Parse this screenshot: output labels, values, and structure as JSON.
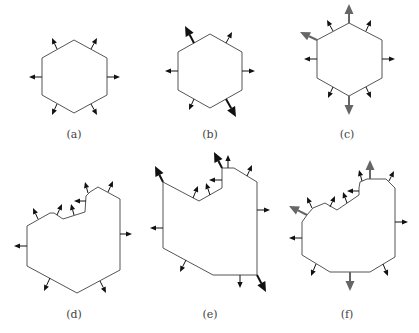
{
  "figure": {
    "colors": {
      "outline": "#555555",
      "arrow_black": "#111111",
      "arrow_gray": "#666666"
    },
    "panels": [
      {
        "id": "a",
        "label": "(a)",
        "label_pos": [
          74,
          128
        ],
        "polygon": [
          [
            74,
            40
          ],
          [
            107,
            58
          ],
          [
            107,
            95
          ],
          [
            74,
            113
          ],
          [
            42,
            95
          ],
          [
            42,
            58
          ]
        ],
        "arrows": [
          {
            "from": [
              57,
              49
            ],
            "to": [
              52,
              38
            ],
            "size": "small",
            "color": "black"
          },
          {
            "from": [
              91,
              49
            ],
            "to": [
              97,
              38
            ],
            "size": "small",
            "color": "black"
          },
          {
            "from": [
              42,
              77
            ],
            "to": [
              29,
              77
            ],
            "size": "small",
            "color": "black"
          },
          {
            "from": [
              107,
              77
            ],
            "to": [
              120,
              77
            ],
            "size": "small",
            "color": "black"
          },
          {
            "from": [
              57,
              104
            ],
            "to": [
              52,
              115
            ],
            "size": "small",
            "color": "black"
          },
          {
            "from": [
              91,
              104
            ],
            "to": [
              97,
              115
            ],
            "size": "small",
            "color": "black"
          }
        ]
      },
      {
        "id": "b",
        "label": "(b)",
        "label_pos": [
          210,
          128
        ],
        "polygon": [
          [
            210,
            34
          ],
          [
            242,
            52
          ],
          [
            242,
            90
          ],
          [
            210,
            108
          ],
          [
            178,
            90
          ],
          [
            178,
            52
          ]
        ],
        "arrows": [
          {
            "from": [
              194,
              43
            ],
            "to": [
              185,
              26
            ],
            "size": "large",
            "color": "black"
          },
          {
            "from": [
              226,
              43
            ],
            "to": [
              232,
              32
            ],
            "size": "small",
            "color": "black"
          },
          {
            "from": [
              178,
              71
            ],
            "to": [
              165,
              71
            ],
            "size": "small",
            "color": "black"
          },
          {
            "from": [
              242,
              71
            ],
            "to": [
              255,
              71
            ],
            "size": "small",
            "color": "black"
          },
          {
            "from": [
              194,
              99
            ],
            "to": [
              189,
              110
            ],
            "size": "small",
            "color": "black"
          },
          {
            "from": [
              226,
              99
            ],
            "to": [
              236,
              117
            ],
            "size": "large",
            "color": "black"
          }
        ]
      },
      {
        "id": "c",
        "label": "(c)",
        "label_pos": [
          347,
          128
        ],
        "polygon": [
          [
            349,
            23
          ],
          [
            382,
            40
          ],
          [
            382,
            78
          ],
          [
            349,
            96
          ],
          [
            317,
            78
          ],
          [
            317,
            40
          ]
        ],
        "arrows": [
          {
            "from": [
              349,
              23
            ],
            "to": [
              349,
              4
            ],
            "size": "large",
            "color": "gray"
          },
          {
            "from": [
              317,
              40
            ],
            "to": [
              300,
              32
            ],
            "size": "large",
            "color": "gray"
          },
          {
            "from": [
              349,
              96
            ],
            "to": [
              349,
              115
            ],
            "size": "large",
            "color": "gray"
          },
          {
            "from": [
              333,
              31
            ],
            "to": [
              327,
              20
            ],
            "size": "small",
            "color": "black"
          },
          {
            "from": [
              366,
              31
            ],
            "to": [
              371,
              20
            ],
            "size": "small",
            "color": "black"
          },
          {
            "from": [
              317,
              59
            ],
            "to": [
              304,
              59
            ],
            "size": "small",
            "color": "black"
          },
          {
            "from": [
              382,
              59
            ],
            "to": [
              395,
              59
            ],
            "size": "small",
            "color": "black"
          },
          {
            "from": [
              333,
              87
            ],
            "to": [
              328,
              98
            ],
            "size": "small",
            "color": "black"
          },
          {
            "from": [
              366,
              87
            ],
            "to": [
              371,
              98
            ],
            "size": "small",
            "color": "black"
          }
        ]
      },
      {
        "id": "d",
        "label": "(d)",
        "label_pos": [
          74,
          308
        ],
        "polygon": [
          [
            27,
            226
          ],
          [
            50,
            213
          ],
          [
            54,
            213
          ],
          [
            63,
            219
          ],
          [
            85,
            212
          ],
          [
            86,
            196
          ],
          [
            90,
            192
          ],
          [
            98,
            187
          ],
          [
            120,
            199
          ],
          [
            120,
            270
          ],
          [
            77,
            293
          ],
          [
            27,
            266
          ]
        ],
        "arrows": [
          {
            "from": [
              38,
              219
            ],
            "to": [
              33,
              208
            ],
            "size": "small",
            "color": "black"
          },
          {
            "from": [
              57,
              215
            ],
            "to": [
              62,
              204
            ],
            "size": "small",
            "color": "black"
          },
          {
            "from": [
              74,
              215
            ],
            "to": [
              71,
              204
            ],
            "size": "small",
            "color": "black"
          },
          {
            "from": [
              86,
              201
            ],
            "to": [
              74,
              201
            ],
            "size": "small",
            "color": "black"
          },
          {
            "from": [
              88,
              193
            ],
            "to": [
              85,
              182
            ],
            "size": "small",
            "color": "black"
          },
          {
            "from": [
              108,
              192
            ],
            "to": [
              113,
              181
            ],
            "size": "small",
            "color": "black"
          },
          {
            "from": [
              120,
              234
            ],
            "to": [
              132,
              234
            ],
            "size": "small",
            "color": "black"
          },
          {
            "from": [
              27,
              246
            ],
            "to": [
              14,
              246
            ],
            "size": "small",
            "color": "black"
          },
          {
            "from": [
              50,
              278
            ],
            "to": [
              44,
              291
            ],
            "size": "small",
            "color": "black"
          },
          {
            "from": [
              100,
              281
            ],
            "to": [
              106,
              293
            ],
            "size": "small",
            "color": "black"
          }
        ]
      },
      {
        "id": "e",
        "label": "(e)",
        "label_pos": [
          210,
          308
        ],
        "polygon": [
          [
            163,
            182
          ],
          [
            199,
            201
          ],
          [
            222,
            188
          ],
          [
            222,
            168
          ],
          [
            234,
            168
          ],
          [
            257,
            182
          ],
          [
            257,
            275
          ],
          [
            213,
            275
          ],
          [
            163,
            248
          ]
        ],
        "arrows": [
          {
            "from": [
              163,
              182
            ],
            "to": [
              155,
              166
            ],
            "size": "large",
            "color": "black"
          },
          {
            "from": [
              222,
              168
            ],
            "to": [
              214,
              152
            ],
            "size": "large",
            "color": "black"
          },
          {
            "from": [
              257,
              275
            ],
            "to": [
              266,
              292
            ],
            "size": "large",
            "color": "black"
          },
          {
            "from": [
              193,
              198
            ],
            "to": [
              198,
              186
            ],
            "size": "small",
            "color": "black"
          },
          {
            "from": [
              210,
              195
            ],
            "to": [
              206,
              183
            ],
            "size": "small",
            "color": "black"
          },
          {
            "from": [
              222,
              180
            ],
            "to": [
              209,
              180
            ],
            "size": "small",
            "color": "black"
          },
          {
            "from": [
              228,
              168
            ],
            "to": [
              228,
              155
            ],
            "size": "small",
            "color": "black"
          },
          {
            "from": [
              247,
              176
            ],
            "to": [
              252,
              165
            ],
            "size": "small",
            "color": "black"
          },
          {
            "from": [
              257,
              210
            ],
            "to": [
              270,
              210
            ],
            "size": "small",
            "color": "black"
          },
          {
            "from": [
              163,
              228
            ],
            "to": [
              150,
              228
            ],
            "size": "small",
            "color": "black"
          },
          {
            "from": [
              186,
              260
            ],
            "to": [
              180,
              272
            ],
            "size": "small",
            "color": "black"
          },
          {
            "from": [
              240,
              275
            ],
            "to": [
              240,
              288
            ],
            "size": "small",
            "color": "black"
          }
        ]
      },
      {
        "id": "f",
        "label": "(f)",
        "label_pos": [
          347,
          308
        ],
        "polygon": [
          [
            307,
            215
          ],
          [
            313,
            208
          ],
          [
            325,
            203
          ],
          [
            337,
            210
          ],
          [
            359,
            195
          ],
          [
            359,
            188
          ],
          [
            360,
            182
          ],
          [
            367,
            179
          ],
          [
            386,
            179
          ],
          [
            395,
            188
          ],
          [
            395,
            257
          ],
          [
            370,
            272
          ],
          [
            330,
            272
          ],
          [
            302,
            255
          ],
          [
            302,
            222
          ]
        ],
        "arrows": [
          {
            "from": [
              307,
              215
            ],
            "to": [
              289,
              206
            ],
            "size": "large",
            "color": "gray"
          },
          {
            "from": [
              370,
              179
            ],
            "to": [
              370,
              160
            ],
            "size": "large",
            "color": "gray"
          },
          {
            "from": [
              350,
              272
            ],
            "to": [
              350,
              291
            ],
            "size": "large",
            "color": "gray"
          },
          {
            "from": [
              312,
              208
            ],
            "to": [
              307,
              197
            ],
            "size": "small",
            "color": "black"
          },
          {
            "from": [
              330,
              207
            ],
            "to": [
              335,
              196
            ],
            "size": "small",
            "color": "black"
          },
          {
            "from": [
              347,
              203
            ],
            "to": [
              343,
              192
            ],
            "size": "small",
            "color": "black"
          },
          {
            "from": [
              359,
              191
            ],
            "to": [
              347,
              191
            ],
            "size": "small",
            "color": "black"
          },
          {
            "from": [
              362,
              181
            ],
            "to": [
              359,
              170
            ],
            "size": "small",
            "color": "black"
          },
          {
            "from": [
              389,
              181
            ],
            "to": [
              394,
              171
            ],
            "size": "small",
            "color": "black"
          },
          {
            "from": [
              395,
              222
            ],
            "to": [
              408,
              222
            ],
            "size": "small",
            "color": "black"
          },
          {
            "from": [
              302,
              238
            ],
            "to": [
              289,
              238
            ],
            "size": "small",
            "color": "black"
          },
          {
            "from": [
              316,
              264
            ],
            "to": [
              311,
              276
            ],
            "size": "small",
            "color": "black"
          },
          {
            "from": [
              383,
              264
            ],
            "to": [
              388,
              276
            ],
            "size": "small",
            "color": "black"
          }
        ]
      }
    ]
  }
}
